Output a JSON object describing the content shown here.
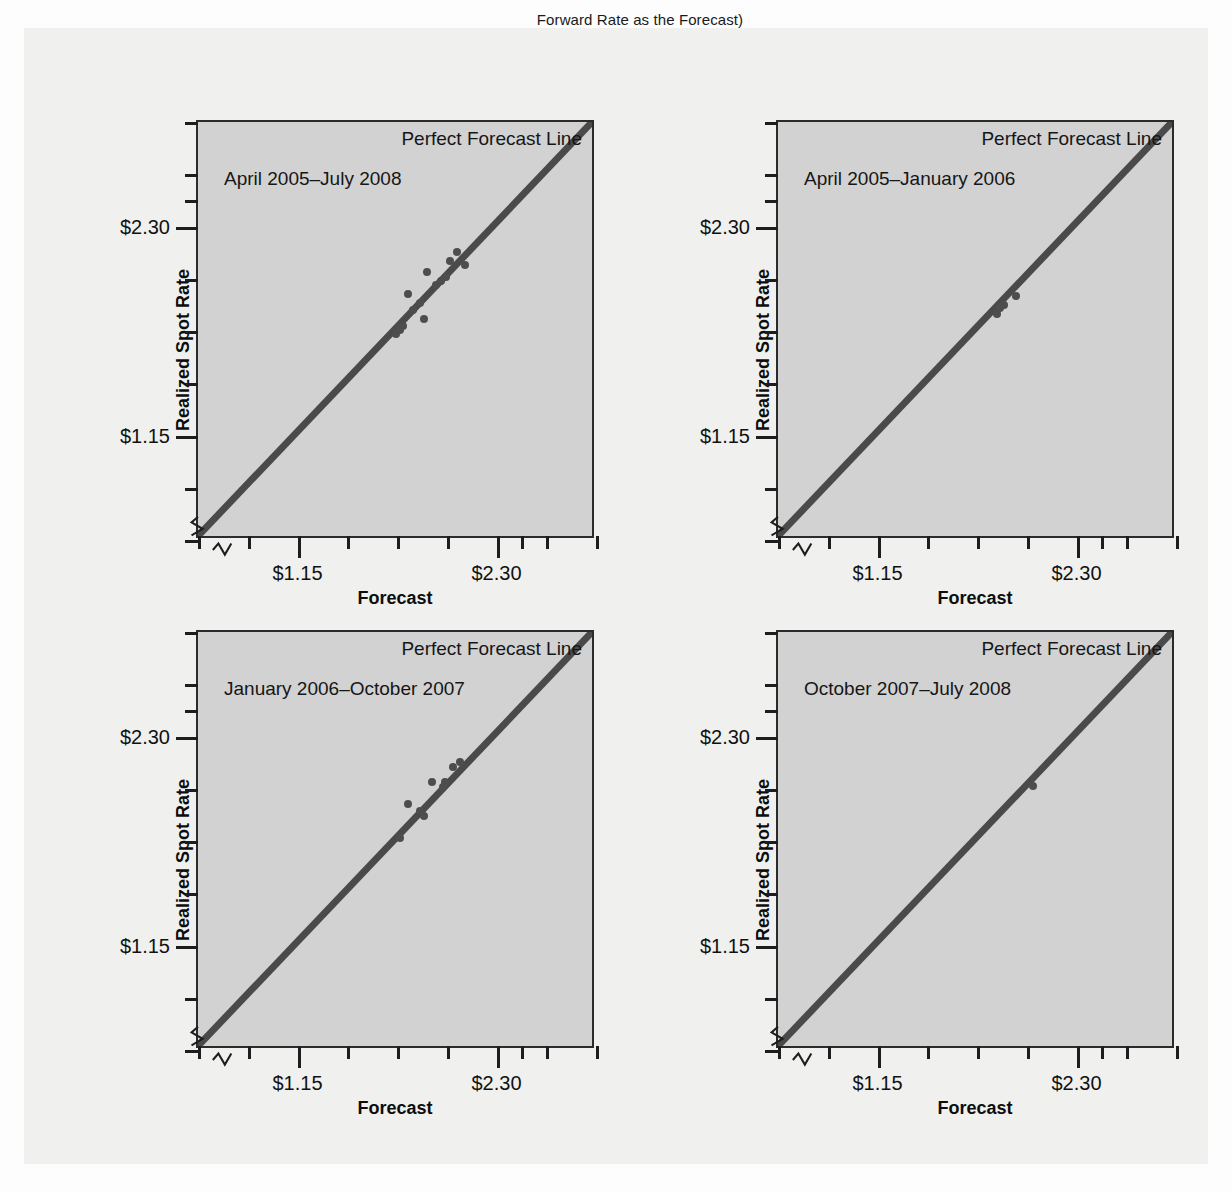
{
  "caption_top": "Forward Rate as the Forecast)",
  "axis": {
    "y_title": "Realized Spot Rate",
    "x_title": "Forecast",
    "y_labels": [
      "$2.30",
      "$1.15"
    ],
    "x_labels": [
      "$1.15",
      "$2.30"
    ],
    "perfect_forecast_label": "Perfect Forecast Line"
  },
  "chart_data": [
    {
      "type": "scatter",
      "title": "April 2005–July 2008",
      "xlabel": "Forecast",
      "ylabel": "Realized Spot Rate",
      "xlim": [
        0.575,
        2.875
      ],
      "ylim": [
        0.575,
        2.875
      ],
      "xticks": [
        0.575,
        0.863,
        1.15,
        1.438,
        1.725,
        2.013,
        2.3,
        2.444,
        2.588,
        2.875
      ],
      "yticks": [
        0.575,
        0.863,
        1.15,
        1.438,
        1.725,
        2.013,
        2.3,
        2.444,
        2.588,
        2.875
      ],
      "xtick_labels": {
        "1.15": "$1.15",
        "2.30": "$2.30"
      },
      "ytick_labels": {
        "1.15": "$1.15",
        "2.30": "$2.30"
      },
      "grid": false,
      "reference_line": {
        "label": "Perfect Forecast Line",
        "slope": 1,
        "intercept": 0
      },
      "points": [
        {
          "x": 1.72,
          "y": 1.71
        },
        {
          "x": 1.74,
          "y": 1.73
        },
        {
          "x": 1.76,
          "y": 1.75
        },
        {
          "x": 1.79,
          "y": 1.93
        },
        {
          "x": 1.82,
          "y": 1.84
        },
        {
          "x": 1.86,
          "y": 1.88
        },
        {
          "x": 1.88,
          "y": 1.79
        },
        {
          "x": 1.9,
          "y": 2.05
        },
        {
          "x": 1.95,
          "y": 1.98
        },
        {
          "x": 1.98,
          "y": 2.0
        },
        {
          "x": 2.01,
          "y": 2.02
        },
        {
          "x": 2.03,
          "y": 2.11
        },
        {
          "x": 2.07,
          "y": 2.16
        },
        {
          "x": 2.12,
          "y": 2.09
        }
      ]
    },
    {
      "type": "scatter",
      "title": "April 2005–January 2006",
      "xlabel": "Forecast",
      "ylabel": "Realized Spot Rate",
      "xlim": [
        0.575,
        2.875
      ],
      "ylim": [
        0.575,
        2.875
      ],
      "xticks": [
        0.575,
        0.863,
        1.15,
        1.438,
        1.725,
        2.013,
        2.3,
        2.444,
        2.588,
        2.875
      ],
      "yticks": [
        0.575,
        0.863,
        1.15,
        1.438,
        1.725,
        2.013,
        2.3,
        2.444,
        2.588,
        2.875
      ],
      "xtick_labels": {
        "1.15": "$1.15",
        "2.30": "$2.30"
      },
      "ytick_labels": {
        "1.15": "$1.15",
        "2.30": "$2.30"
      },
      "grid": false,
      "reference_line": {
        "label": "Perfect Forecast Line",
        "slope": 1,
        "intercept": 0
      },
      "points": [
        {
          "x": 1.84,
          "y": 1.82
        },
        {
          "x": 1.86,
          "y": 1.85
        },
        {
          "x": 1.88,
          "y": 1.87
        },
        {
          "x": 1.95,
          "y": 1.92
        }
      ]
    },
    {
      "type": "scatter",
      "title": "January 2006–October 2007",
      "xlabel": "Forecast",
      "ylabel": "Realized Spot Rate",
      "xlim": [
        0.575,
        2.875
      ],
      "ylim": [
        0.575,
        2.875
      ],
      "xticks": [
        0.575,
        0.863,
        1.15,
        1.438,
        1.725,
        2.013,
        2.3,
        2.444,
        2.588,
        2.875
      ],
      "yticks": [
        0.575,
        0.863,
        1.15,
        1.438,
        1.725,
        2.013,
        2.3,
        2.444,
        2.588,
        2.875
      ],
      "xtick_labels": {
        "1.15": "$1.15",
        "2.30": "$2.30"
      },
      "ytick_labels": {
        "1.15": "$1.15",
        "2.30": "$2.30"
      },
      "grid": false,
      "reference_line": {
        "label": "Perfect Forecast Line",
        "slope": 1,
        "intercept": 0
      },
      "points": [
        {
          "x": 1.74,
          "y": 1.74
        },
        {
          "x": 1.79,
          "y": 1.93
        },
        {
          "x": 1.86,
          "y": 1.89
        },
        {
          "x": 1.88,
          "y": 1.86
        },
        {
          "x": 1.93,
          "y": 2.05
        },
        {
          "x": 1.99,
          "y": 2.02
        },
        {
          "x": 2.0,
          "y": 2.05
        },
        {
          "x": 2.05,
          "y": 2.13
        },
        {
          "x": 2.09,
          "y": 2.16
        }
      ]
    },
    {
      "type": "scatter",
      "title": "October 2007–July 2008",
      "xlabel": "Forecast",
      "ylabel": "Realized Spot Rate",
      "xlim": [
        0.575,
        2.875
      ],
      "ylim": [
        0.575,
        2.875
      ],
      "xticks": [
        0.575,
        0.863,
        1.15,
        1.438,
        1.725,
        2.013,
        2.3,
        2.444,
        2.588,
        2.875
      ],
      "yticks": [
        0.575,
        0.863,
        1.15,
        1.438,
        1.725,
        2.013,
        2.3,
        2.444,
        2.588,
        2.875
      ],
      "xtick_labels": {
        "1.15": "$1.15",
        "2.30": "$2.30"
      },
      "ytick_labels": {
        "1.15": "$1.15",
        "2.30": "$2.30"
      },
      "grid": false,
      "reference_line": {
        "label": "Perfect Forecast Line",
        "slope": 1,
        "intercept": 0
      },
      "points": [
        {
          "x": 2.05,
          "y": 2.03
        }
      ]
    }
  ],
  "colors": {
    "plot_background": "#d2d2d2",
    "line": "#4a4a4a",
    "point": "#4d4d4d",
    "frame": "#2b2b2b",
    "page": "#f0f0ee"
  }
}
